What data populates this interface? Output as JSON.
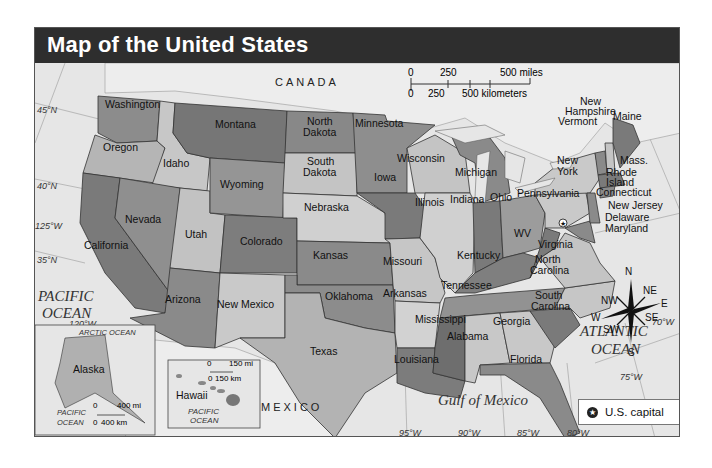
{
  "title": "Map of the United States",
  "scale": {
    "miles_ticks": [
      "0",
      "250",
      "500 miles"
    ],
    "km_ticks": [
      "0",
      "250",
      "500 kilometers"
    ]
  },
  "countries": {
    "canada": "CANADA",
    "mexico": "MEXICO"
  },
  "water": {
    "pacific": [
      "PACIFIC",
      "OCEAN"
    ],
    "atlantic": [
      "ATLANTIC",
      "OCEAN"
    ],
    "gulf": "Gulf of Mexico"
  },
  "graticule": {
    "lat_45": "45°N",
    "lat_40": "40°N",
    "lat_35": "35°N",
    "lon_125": "125°W",
    "lon_120": "120°W",
    "lon_95": "95°W",
    "lon_90": "90°W",
    "lon_85": "85°W",
    "lon_80": "80°W",
    "lon_75": "75°W",
    "lon_70": "70°W"
  },
  "states": {
    "washington": "Washington",
    "oregon": "Oregon",
    "california": "California",
    "idaho": "Idaho",
    "nevada": "Nevada",
    "utah": "Utah",
    "arizona": "Arizona",
    "montana": "Montana",
    "wyoming": "Wyoming",
    "colorado": "Colorado",
    "new_mexico": "New Mexico",
    "north_dakota": [
      "North",
      "Dakota"
    ],
    "south_dakota": [
      "South",
      "Dakota"
    ],
    "nebraska": "Nebraska",
    "kansas": "Kansas",
    "oklahoma": "Oklahoma",
    "texas": "Texas",
    "minnesota": "Minnesota",
    "iowa": "Iowa",
    "missouri": "Missouri",
    "arkansas": "Arkansas",
    "louisiana": "Louisiana",
    "wisconsin": "Wisconsin",
    "illinois": "Illinois",
    "michigan": "Michigan",
    "indiana": "Indiana",
    "ohio": "Ohio",
    "kentucky": "Kentucky",
    "tennessee": "Tennessee",
    "mississippi": "Mississippi",
    "alabama": "Alabama",
    "georgia": "Georgia",
    "florida": "Florida",
    "south_carolina": [
      "South",
      "Carolina"
    ],
    "north_carolina": [
      "North",
      "Carolina"
    ],
    "virginia": "Virginia",
    "west_virginia": "WV",
    "pennsylvania": "Pennsylvania",
    "new_york": [
      "New",
      "York"
    ],
    "maryland": "Maryland",
    "delaware": "Delaware",
    "new_jersey": "New Jersey",
    "connecticut": "Connecticut",
    "rhode_island": [
      "Rhode",
      "Island"
    ],
    "massachusetts": "Mass.",
    "vermont": "Vermont",
    "new_hampshire": [
      "New",
      "Hampshire"
    ],
    "maine": "Maine"
  },
  "inset_alaska": {
    "label": "Alaska",
    "arctic": "ARCTIC OCEAN",
    "pacific": [
      "PACIFIC",
      "OCEAN"
    ],
    "scale_mi": [
      "0",
      "400 mi"
    ],
    "scale_km": [
      "0",
      "400 km"
    ]
  },
  "inset_hawaii": {
    "label": "Hawaii",
    "pacific": [
      "PACIFIC",
      "OCEAN"
    ],
    "scale_mi": [
      "0",
      "150 mi"
    ],
    "scale_km": [
      "0",
      "150 km"
    ]
  },
  "compass": {
    "N": "N",
    "S": "S",
    "E": "E",
    "W": "W",
    "NE": "NE",
    "NW": "NW",
    "SE": "SE",
    "SW": "SW"
  },
  "legend": {
    "label": "U.S. capital",
    "symbol": "★"
  },
  "colors": {
    "title_bar": "#2e2e2e",
    "water": "#e6e6e6",
    "dark": "#7a7a7a",
    "mid": "#9b9b9b",
    "light": "#c4c4c4"
  }
}
